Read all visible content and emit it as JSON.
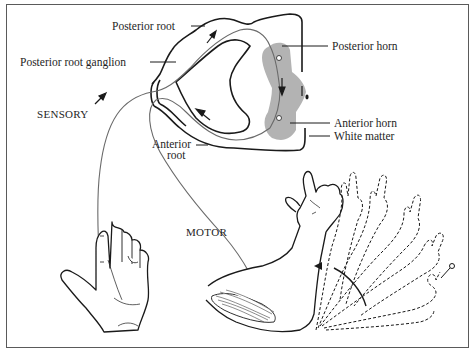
{
  "figure": {
    "labels": {
      "posterior_root": "Posterior root",
      "posterior_root_ganglion": "Posterior root ganglion",
      "posterior_horn": "Posterior horn",
      "anterior_horn": "Anterior horn",
      "white_matter": "White matter",
      "anterior_root_line1": "Anterior",
      "anterior_root_line2": "root",
      "sensory": "SENSORY",
      "motor": "MOTOR"
    },
    "colors": {
      "line": "#1a1a1a",
      "nerve": "#6a6a6a",
      "gray_matter": "#b3b3b3",
      "frame": "#5a5a5a",
      "background": "#ffffff"
    }
  }
}
